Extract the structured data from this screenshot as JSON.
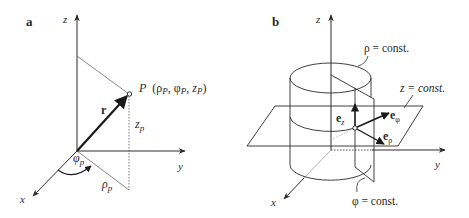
{
  "figure": {
    "panel_a": {
      "label": "a",
      "axes": {
        "x": "x",
        "y": "y",
        "z": "z"
      },
      "point_label": "P (ρp, φp, zp)",
      "point_label_parts": {
        "P": "P",
        "coords": "(ρ",
        "sub1": "P",
        "sep1": ", φ",
        "sub2": "P",
        "sep2": ", z",
        "sub3": "P",
        "close": ")"
      },
      "vector": "r",
      "z_coord": "z",
      "z_sub": "p",
      "phi_coord": "φ",
      "phi_sub": "p",
      "rho_coord": "ρ",
      "rho_sub": "p"
    },
    "panel_b": {
      "label": "b",
      "axes": {
        "x": "x",
        "y": "y",
        "z": "z"
      },
      "surfaces": {
        "rho": "ρ = const.",
        "z": "z = const.",
        "phi": "φ = const."
      },
      "unit_vectors": {
        "e": "e",
        "z_sub": "z",
        "phi_sub": "φ",
        "rho_sub": "ρ"
      }
    }
  },
  "colors": {
    "line": "#2a2a2a",
    "background": "#ffffff"
  }
}
